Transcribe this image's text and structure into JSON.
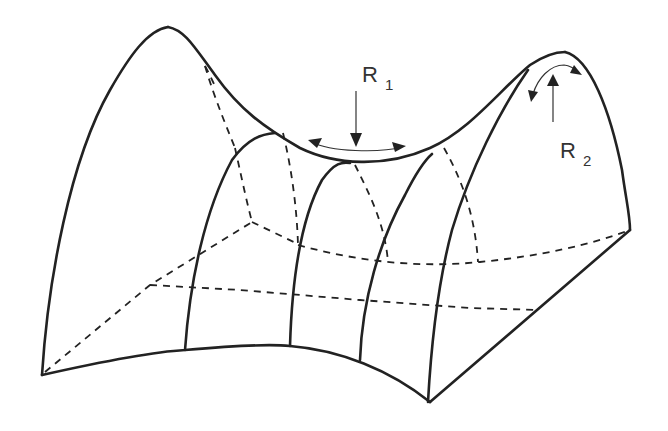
{
  "diagram": {
    "labels": {
      "r1": {
        "main": "R",
        "sub": "1"
      },
      "r2": {
        "main": "R",
        "sub": "2"
      }
    },
    "colors": {
      "stroke": "#222222",
      "background": "#ffffff"
    }
  }
}
